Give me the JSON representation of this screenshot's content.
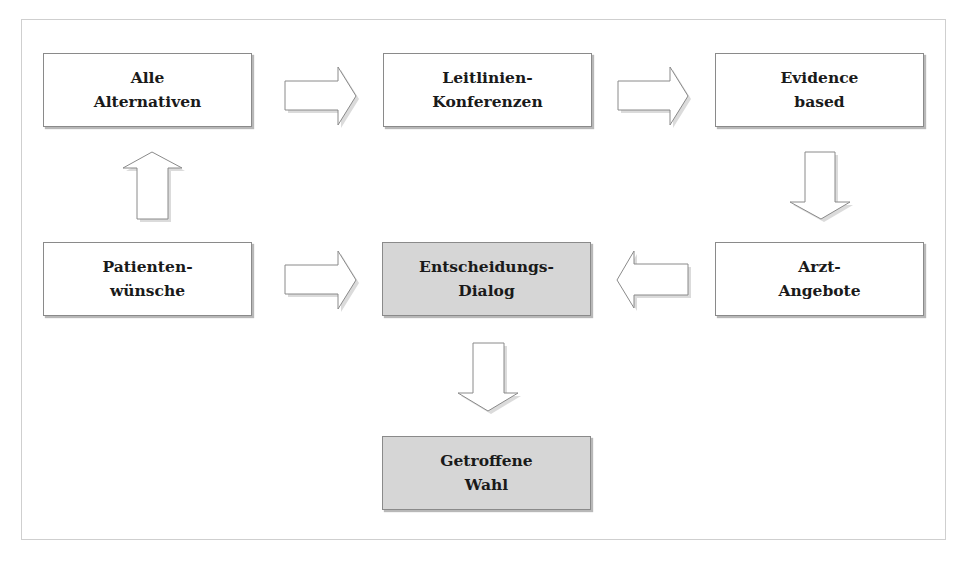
{
  "diagram": {
    "type": "flowchart",
    "nodes": {
      "alle_alternativen": {
        "line1": "Alle",
        "line2": "Alternativen",
        "shaded": false
      },
      "leitlinien_konferenzen": {
        "line1": "Leitlinien-",
        "line2": "Konferenzen",
        "shaded": false
      },
      "evidence_based": {
        "line1": "Evidence",
        "line2": "based",
        "shaded": false
      },
      "patientenwuensche": {
        "line1": "Patienten-",
        "line2": "wünsche",
        "shaded": false
      },
      "entscheidungs_dialog": {
        "line1": "Entscheidungs-",
        "line2": "Dialog",
        "shaded": true
      },
      "arzt_angebote": {
        "line1": "Arzt-",
        "line2": "Angebote",
        "shaded": false
      },
      "getroffene_wahl": {
        "line1": "Getroffene",
        "line2": "Wahl",
        "shaded": true
      }
    },
    "edges": [
      {
        "from": "Patientenwünsche",
        "to": "Alle Alternativen",
        "direction": "up"
      },
      {
        "from": "Alle Alternativen",
        "to": "Leitlinien-Konferenzen",
        "direction": "right"
      },
      {
        "from": "Leitlinien-Konferenzen",
        "to": "Evidence based",
        "direction": "right"
      },
      {
        "from": "Evidence based",
        "to": "Arzt-Angebote",
        "direction": "down"
      },
      {
        "from": "Arzt-Angebote",
        "to": "Entscheidungs-Dialog",
        "direction": "left"
      },
      {
        "from": "Patientenwünsche",
        "to": "Entscheidungs-Dialog",
        "direction": "right"
      },
      {
        "from": "Entscheidungs-Dialog",
        "to": "Getroffene Wahl",
        "direction": "down"
      }
    ],
    "colors": {
      "box_fill": "#ffffff",
      "shaded_fill": "#d6d6d6",
      "border": "#8a8a8a",
      "text": "#1a1a1a",
      "frame": "#cfcfcf"
    }
  }
}
